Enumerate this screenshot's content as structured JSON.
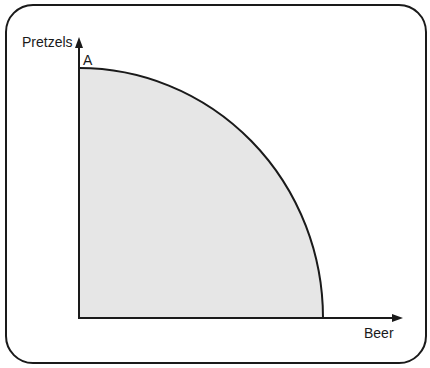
{
  "diagram": {
    "type": "production-possibilities-frontier",
    "y_axis_label": "Pretzels",
    "x_axis_label": "Beer",
    "point_label": "A",
    "fill_color": "#e6e6e6",
    "line_color": "#1a1a1a"
  }
}
